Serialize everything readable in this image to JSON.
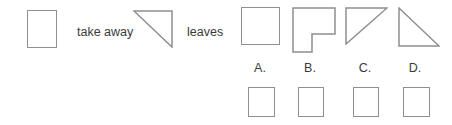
{
  "colors": {
    "line": "#8f8f8f",
    "text": "#3a3a3a",
    "background": "#ffffff"
  },
  "question": {
    "minuend_shape": "square-outline",
    "take_away_label": "take away",
    "subtrahend_shape": "right-triangle-right-angle-top-right",
    "leaves_label": "leaves"
  },
  "options": [
    {
      "label": "A.",
      "shape": "square-outline"
    },
    {
      "label": "B.",
      "shape": "square-missing-bottom-right-corner"
    },
    {
      "label": "C.",
      "shape": "right-triangle-right-angle-top-left"
    },
    {
      "label": "D.",
      "shape": "right-triangle-right-angle-bottom-left"
    }
  ],
  "answer_boxes": {
    "count": 4
  }
}
